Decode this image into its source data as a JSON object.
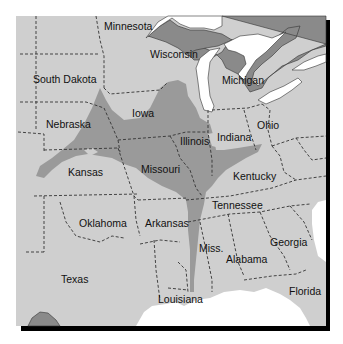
{
  "map": {
    "title": "",
    "colors": {
      "land": "#cfcfcf",
      "highlight": "#9a9a9a",
      "foreign_land": "#8a8a8a",
      "water": "#ffffff",
      "shadow": "#000000",
      "border": "#333333",
      "label": "#111111"
    },
    "state_labels": [
      {
        "id": "minnesota",
        "text": "Minnesota",
        "x": 104,
        "y": 30
      },
      {
        "id": "wisconsin",
        "text": "Wisconsin",
        "x": 150,
        "y": 58
      },
      {
        "id": "michigan",
        "text": "Michigan",
        "x": 222,
        "y": 84
      },
      {
        "id": "south-dakota",
        "text": "South Dakota",
        "x": 33,
        "y": 83
      },
      {
        "id": "iowa",
        "text": "Iowa",
        "x": 132,
        "y": 117
      },
      {
        "id": "nebraska",
        "text": "Nebraska",
        "x": 46,
        "y": 128
      },
      {
        "id": "illinois",
        "text": "Illinois",
        "x": 180,
        "y": 145
      },
      {
        "id": "indiana",
        "text": "Indiana",
        "x": 217,
        "y": 141
      },
      {
        "id": "ohio",
        "text": "Ohio",
        "x": 257,
        "y": 129
      },
      {
        "id": "kansas",
        "text": "Kansas",
        "x": 68,
        "y": 176
      },
      {
        "id": "missouri",
        "text": "Missouri",
        "x": 141,
        "y": 173
      },
      {
        "id": "kentucky",
        "text": "Kentucky",
        "x": 233,
        "y": 180
      },
      {
        "id": "tennessee",
        "text": "Tennessee",
        "x": 212,
        "y": 209
      },
      {
        "id": "oklahoma",
        "text": "Oklahoma",
        "x": 79,
        "y": 227
      },
      {
        "id": "arkansas",
        "text": "Arkansas",
        "x": 145,
        "y": 227
      },
      {
        "id": "georgia",
        "text": "Georgia",
        "x": 270,
        "y": 246
      },
      {
        "id": "mississippi",
        "text": "Miss.",
        "x": 199,
        "y": 252
      },
      {
        "id": "alabama",
        "text": "Alabama",
        "x": 226,
        "y": 263
      },
      {
        "id": "texas",
        "text": "Texas",
        "x": 61,
        "y": 283
      },
      {
        "id": "louisiana",
        "text": "Louisiana",
        "x": 158,
        "y": 303
      },
      {
        "id": "florida",
        "text": "Florida",
        "x": 289,
        "y": 295
      }
    ]
  }
}
